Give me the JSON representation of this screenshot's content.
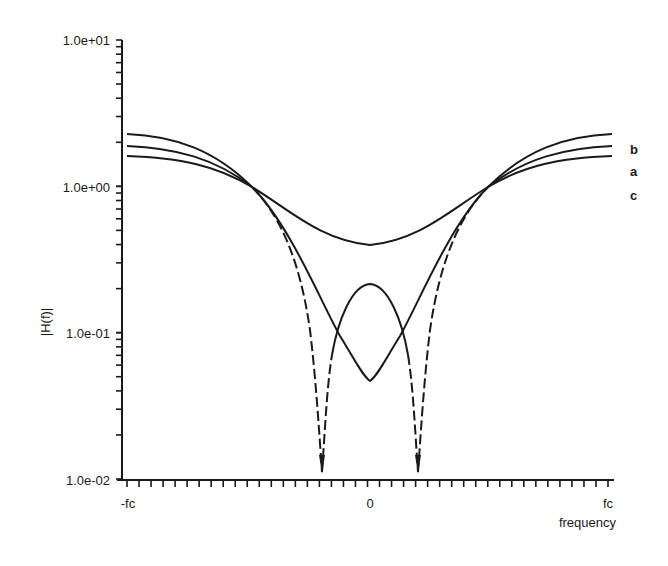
{
  "chart_data": {
    "type": "line",
    "title": "",
    "xlabel": "frequency",
    "ylabel": "|H(f)|",
    "yscale": "log",
    "ylim": [
      0.01,
      10
    ],
    "xlim": [
      "-fc",
      "fc"
    ],
    "x_tick_labels": [
      "-fc",
      "0",
      "fc"
    ],
    "y_tick_labels": [
      "1.0e-02",
      "1.0e-01",
      "1.0e+00",
      "1.0e+01"
    ],
    "grid": false,
    "legend": "inline labels at right end of curves",
    "x_normalized": [
      -1.0,
      -0.8,
      -0.6,
      -0.45,
      -0.3,
      -0.2,
      -0.1,
      0.0,
      0.1,
      0.2,
      0.3,
      0.45,
      0.6,
      0.8,
      1.0
    ],
    "series": [
      {
        "name": "b",
        "style": "solid/dashed (dashed near nulls)",
        "values": [
          2.2,
          2.05,
          1.6,
          1.0,
          0.3,
          0.01,
          0.1,
          0.21,
          0.1,
          0.01,
          0.3,
          1.0,
          1.6,
          2.05,
          2.2
        ]
      },
      {
        "name": "a",
        "style": "solid/dashed (dashed near crossings)",
        "values": [
          1.9,
          1.8,
          1.45,
          1.0,
          0.45,
          0.22,
          0.1,
          0.047,
          0.1,
          0.22,
          0.45,
          1.0,
          1.45,
          1.8,
          1.9
        ]
      },
      {
        "name": "c",
        "style": "solid",
        "values": [
          1.6,
          1.5,
          1.3,
          1.0,
          0.7,
          0.52,
          0.43,
          0.4,
          0.43,
          0.52,
          0.7,
          1.0,
          1.3,
          1.5,
          1.6
        ]
      }
    ],
    "annotations": [
      "b",
      "a",
      "c"
    ]
  },
  "labels": {
    "y_top": "1.0e+01",
    "y_1": "1.0e+00",
    "y_01": "1.0e-01",
    "y_bottom": "1.0e-02",
    "ylabel": "|H(f)|",
    "x_left": "-fc",
    "x_mid": "0",
    "x_right": "fc",
    "xlabel": "frequency",
    "curve_b": "b",
    "curve_a": "a",
    "curve_c": "c"
  },
  "colors": {
    "ink": "#1a1a1a",
    "background": "#ffffff"
  }
}
